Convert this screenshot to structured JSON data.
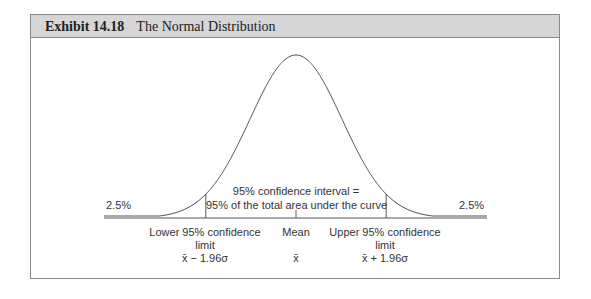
{
  "exhibit": {
    "number": "Exhibit 14.18",
    "title": "The Normal Distribution"
  },
  "chart_data": {
    "type": "area",
    "title": "The Normal Distribution",
    "annotations": {
      "left_tail": "2.5%",
      "right_tail": "2.5%",
      "center_line1": "95% confidence interval =",
      "center_line2": "95% of the total area under the curve"
    },
    "x_markers": [
      {
        "label_line1": "Lower 95% confidence",
        "label_line2": "limit",
        "formula": "x̄ − 1.96σ",
        "z": -1.96
      },
      {
        "label_line1": "Mean",
        "label_line2": "",
        "formula": "x̄",
        "z": 0
      },
      {
        "label_line1": "Upper 95% confidence",
        "label_line2": "limit",
        "formula": "x̄ + 1.96σ",
        "z": 1.96
      }
    ],
    "grid": false,
    "legend": false
  }
}
